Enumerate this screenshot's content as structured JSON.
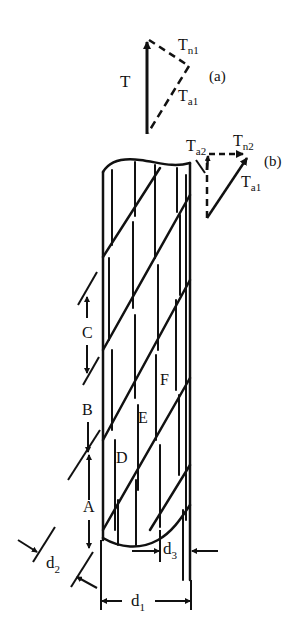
{
  "figure": {
    "stroke_color": "#111111",
    "background": "#ffffff"
  },
  "vector_diagram_a": {
    "tag": "(a)",
    "T": "T",
    "Tn1_main": "T",
    "Tn1_sub": "n1",
    "Ta1_main": "T",
    "Ta1_sub": "a1"
  },
  "vector_diagram_b": {
    "tag": "(b)",
    "Ta2_main": "T",
    "Ta2_sub": "a2",
    "Tn2_main": "T",
    "Tn2_sub": "n2",
    "Ta1_main": "T",
    "Ta1_sub": "a1"
  },
  "segments": {
    "A": "A",
    "B": "B",
    "C": "C"
  },
  "regions": {
    "D": "D",
    "E": "E",
    "F": "F"
  },
  "dimensions": {
    "d1_main": "d",
    "d1_sub": "1",
    "d2_main": "d",
    "d2_sub": "2",
    "d3_main": "d",
    "d3_sub": "3"
  }
}
